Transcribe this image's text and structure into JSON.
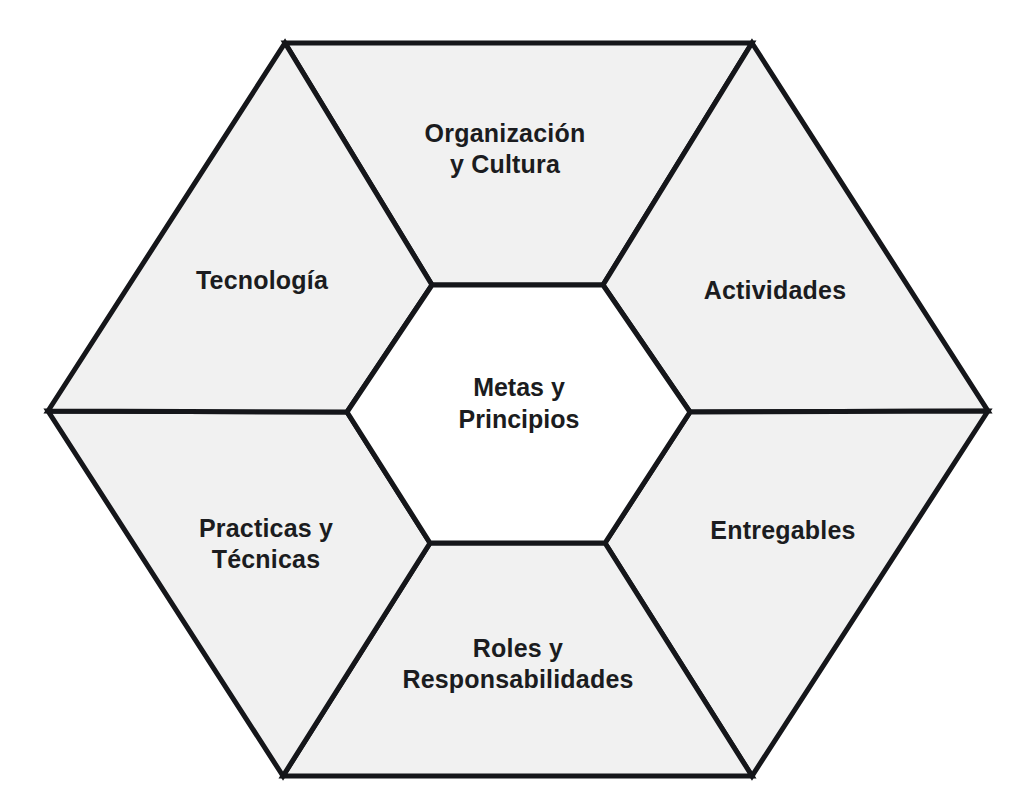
{
  "diagram": {
    "type": "hexagon-framework",
    "language": "es",
    "shape": "hexagon",
    "segment_count": 6,
    "colors": {
      "segment_fill": "#f1f1f1",
      "core_fill": "#ffffff",
      "stroke": "#15161a",
      "text": "#1b1c20",
      "background": "#ffffff"
    },
    "core": {
      "name": "metas-y-principios",
      "label": "Metas y\nPrincipios",
      "label_x": 519,
      "label_y": 403
    },
    "segments": [
      {
        "name": "organizacion-y-cultura",
        "label": "Organización\ny Cultura",
        "position": "top",
        "label_x": 505,
        "label_y": 148
      },
      {
        "name": "actividades",
        "label": "Actividades",
        "position": "top-right",
        "label_x": 775,
        "label_y": 290
      },
      {
        "name": "entregables",
        "label": "Entregables",
        "position": "bottom-right",
        "label_x": 783,
        "label_y": 530
      },
      {
        "name": "roles-y-responsabilidades",
        "label": "Roles y\nResponsabilidades",
        "position": "bottom",
        "label_x": 518,
        "label_y": 663
      },
      {
        "name": "practicas-y-tecnicas",
        "label": "Practicas y\nTécnicas",
        "position": "bottom-left",
        "label_x": 266,
        "label_y": 543
      },
      {
        "name": "tecnologia",
        "label": "Tecnología",
        "position": "top-left",
        "label_x": 262,
        "label_y": 280
      }
    ]
  }
}
